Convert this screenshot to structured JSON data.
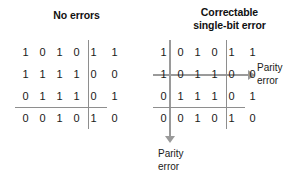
{
  "diagram": {
    "panels": [
      {
        "id": "no-errors",
        "title": "No errors",
        "rows": [
          {
            "bits": [
              "1",
              "0",
              "1",
              "0",
              "1"
            ],
            "parity": "1"
          },
          {
            "bits": [
              "1",
              "1",
              "1",
              "1",
              "0"
            ],
            "parity": "0"
          },
          {
            "bits": [
              "0",
              "1",
              "1",
              "1",
              "0"
            ],
            "parity": "1"
          }
        ],
        "parity_row": {
          "bits": [
            "0",
            "0",
            "1",
            "0",
            "1"
          ],
          "parity": "0"
        }
      },
      {
        "id": "correctable-single-bit-error",
        "title_line1": "Correctable",
        "title_line2": "single-bit error",
        "rows": [
          {
            "bits": [
              "1",
              "0",
              "1",
              "0",
              "1"
            ],
            "parity": "1"
          },
          {
            "bits": [
              "1",
              "0",
              "1",
              "1",
              "0"
            ],
            "parity": "0"
          },
          {
            "bits": [
              "0",
              "1",
              "1",
              "1",
              "0"
            ],
            "parity": "1"
          }
        ],
        "parity_row": {
          "bits": [
            "0",
            "0",
            "1",
            "0",
            "1"
          ],
          "parity": "0"
        }
      }
    ],
    "annotations": {
      "row_error_line1": "Parity",
      "row_error_line2": "error",
      "column_error_line1": "Parity",
      "column_error_line2": "error"
    },
    "colors": {
      "text": "#1a1a1a",
      "rule": "#8e8e8e",
      "arrow": "#9a9a9a",
      "background": "#ffffff"
    }
  }
}
